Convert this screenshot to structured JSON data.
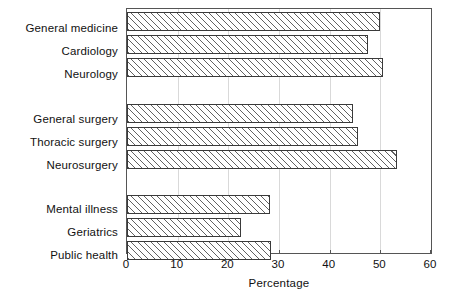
{
  "chart_data": {
    "type": "bar",
    "orientation": "horizontal",
    "title": "",
    "xlabel": "Percentage",
    "ylabel": "",
    "xlim": [
      0,
      60
    ],
    "xticks": [
      0,
      10,
      20,
      30,
      40,
      50,
      60
    ],
    "grid": true,
    "grid_axis": "x",
    "legend": null,
    "categories": [
      "General medicine",
      "Cardiology",
      "Neurology",
      "",
      "General surgery",
      "Thoracic surgery",
      "Neurosurgery",
      "",
      "Mental illness",
      "Geriatrics",
      "Public health"
    ],
    "values": [
      50.0,
      47.5,
      50.5,
      null,
      44.5,
      45.5,
      53.3,
      null,
      28.2,
      22.4,
      28.4
    ],
    "groups": [
      {
        "name": "Medicine",
        "categories": [
          "General medicine",
          "Cardiology",
          "Neurology"
        ],
        "values": [
          50.0,
          47.5,
          50.5
        ]
      },
      {
        "name": "Surgery",
        "categories": [
          "General surgery",
          "Thoracic surgery",
          "Neurosurgery"
        ],
        "values": [
          44.5,
          45.5,
          53.3
        ]
      },
      {
        "name": "Other",
        "categories": [
          "Mental illness",
          "Geriatrics",
          "Public health"
        ],
        "values": [
          28.2,
          22.4,
          28.4
        ]
      }
    ],
    "bar_style": {
      "fill": "#ffffff",
      "hatch": "/",
      "edge_color": "#3a3a3a"
    }
  },
  "axis": {
    "x_tick_labels": [
      "0",
      "10",
      "20",
      "30",
      "40",
      "50",
      "60"
    ],
    "x_axis_title": "Percentage"
  },
  "colors": {
    "background": "#ffffff",
    "frame": "#555555",
    "gridline": "#d9d9d9",
    "text": "#111111",
    "bar_edge": "#3a3a3a",
    "hatch": "#464646"
  }
}
